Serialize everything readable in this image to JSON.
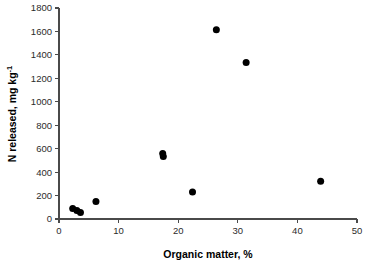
{
  "chart_data": {
    "type": "scatter",
    "title": "",
    "xlabel": "Organic matter, %",
    "ylabel": "N released, mg kg-1",
    "ylabel_base": "N released, mg kg",
    "ylabel_exponent": "-1",
    "xlim": [
      0,
      50
    ],
    "ylim": [
      0,
      1800
    ],
    "xticks": [
      0,
      10,
      20,
      30,
      40,
      50
    ],
    "yticks": [
      0,
      200,
      400,
      600,
      800,
      1000,
      1200,
      1400,
      1600,
      1800
    ],
    "xtick_labels": [
      "0",
      "10",
      "20",
      "30",
      "40",
      "50"
    ],
    "ytick_labels": [
      "0",
      "200",
      "400",
      "600",
      "800",
      "1000",
      "1200",
      "1400",
      "1600",
      "1800"
    ],
    "grid": false,
    "legend": false,
    "marker": "filled-circle",
    "marker_color": "#000000",
    "marker_size": 7,
    "series": [
      {
        "name": "N released vs organic matter",
        "points": [
          {
            "x": 2.3,
            "y": 90
          },
          {
            "x": 3.0,
            "y": 72
          },
          {
            "x": 3.6,
            "y": 55
          },
          {
            "x": 6.2,
            "y": 150
          },
          {
            "x": 17.4,
            "y": 558
          },
          {
            "x": 17.5,
            "y": 533
          },
          {
            "x": 22.4,
            "y": 230
          },
          {
            "x": 26.4,
            "y": 1615
          },
          {
            "x": 31.4,
            "y": 1335
          },
          {
            "x": 43.9,
            "y": 322
          }
        ]
      }
    ]
  }
}
